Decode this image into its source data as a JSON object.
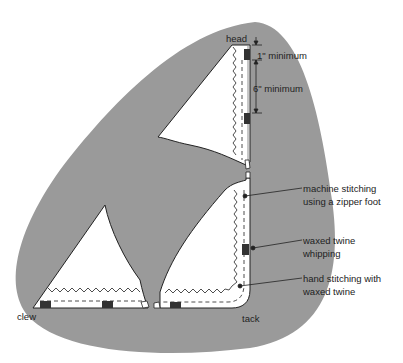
{
  "diagram": {
    "colors": {
      "background": "#ffffff",
      "blob": "#9a9a9a",
      "sail": "#ffffff",
      "outline": "#222222",
      "whipping": "#333333"
    },
    "corners": {
      "head": "head",
      "clew": "clew",
      "tack": "tack"
    },
    "dimensions": [
      {
        "id": "top",
        "label": "1\" minimum"
      },
      {
        "id": "spacing",
        "label": "6\" minimum"
      }
    ],
    "callouts": [
      {
        "id": "machine",
        "line1": "machine stitching",
        "line2": "using a zipper foot"
      },
      {
        "id": "whipping",
        "line1": "waxed twine",
        "line2": "whipping"
      },
      {
        "id": "hand",
        "line1": "hand stitching with",
        "line2": "waxed twine"
      }
    ]
  }
}
